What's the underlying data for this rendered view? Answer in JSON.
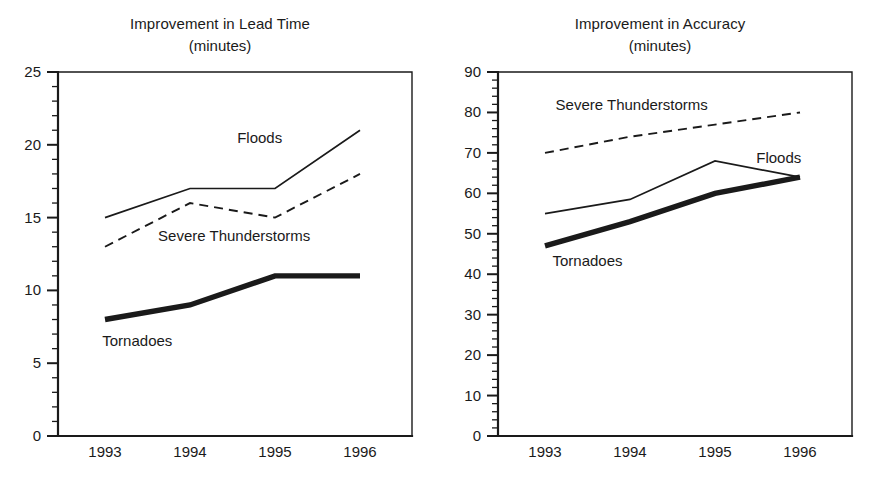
{
  "figure": {
    "background": "#ffffff",
    "ink_color": "#1a1a1a",
    "width": 880,
    "height": 478
  },
  "panels": [
    {
      "id": "lead-time",
      "title": "Improvement in Lead Time",
      "subtitle": "(minutes)"
    },
    {
      "id": "accuracy",
      "title": "Improvement in Accuracy",
      "subtitle": "(minutes)"
    }
  ],
  "chart_data": [
    {
      "type": "line",
      "title": "Improvement in Lead Time",
      "subtitle": "(minutes)",
      "xlabel": "",
      "ylabel": "",
      "categories": [
        "1993",
        "1994",
        "1995",
        "1996"
      ],
      "x": [
        1993,
        1994,
        1995,
        1996
      ],
      "ylim": [
        0,
        25
      ],
      "y_major_tick_step": 5,
      "y_minor_tick_step": 1,
      "y_tick_labels": [
        "0",
        "5",
        "10",
        "15",
        "20",
        "25"
      ],
      "grid": false,
      "legend": "inline-annotations",
      "series": [
        {
          "name": "Floods",
          "style": "thin-solid",
          "values": [
            15,
            17,
            17,
            21
          ],
          "label": "Floods",
          "label_x": 1994.82,
          "label_y": 20.4,
          "label_anchor": "middle"
        },
        {
          "name": "Severe Thunderstorms",
          "style": "dashed",
          "values": [
            13,
            16,
            15,
            18
          ],
          "label": "Severe Thunderstorms",
          "label_x": 1994.52,
          "label_y": 13.65,
          "label_anchor": "middle"
        },
        {
          "name": "Tornadoes",
          "style": "thick-solid",
          "values": [
            8,
            9,
            11,
            11
          ],
          "label": "Tornadoes",
          "label_x": 1993.38,
          "label_y": 6.45,
          "label_anchor": "middle"
        }
      ]
    },
    {
      "type": "line",
      "title": "Improvement in Accuracy",
      "subtitle": "(minutes)",
      "xlabel": "",
      "ylabel": "",
      "categories": [
        "1993",
        "1994",
        "1995",
        "1996"
      ],
      "x": [
        1993,
        1994,
        1995,
        1996
      ],
      "ylim": [
        0,
        90
      ],
      "y_major_tick_step": 10,
      "y_minor_tick_step": 2,
      "y_tick_labels": [
        "0",
        "10",
        "20",
        "30",
        "40",
        "50",
        "60",
        "70",
        "80",
        "90"
      ],
      "grid": false,
      "legend": "inline-annotations",
      "series": [
        {
          "name": "Severe Thunderstorms",
          "style": "dashed",
          "values": [
            70,
            74,
            77,
            80
          ],
          "label": "Severe Thunderstorms",
          "label_x": 1994.02,
          "label_y": 81.5,
          "label_anchor": "middle"
        },
        {
          "name": "Floods",
          "style": "thin-solid",
          "values": [
            55,
            58.5,
            68,
            64
          ],
          "label": "Floods",
          "label_x": 1995.75,
          "label_y": 68.5,
          "label_anchor": "middle"
        },
        {
          "name": "Tornadoes",
          "style": "thick-solid",
          "values": [
            47,
            53,
            60,
            64
          ],
          "label": "Tornadoes",
          "label_x": 1993.5,
          "label_y": 43.0,
          "label_anchor": "middle"
        }
      ]
    }
  ]
}
